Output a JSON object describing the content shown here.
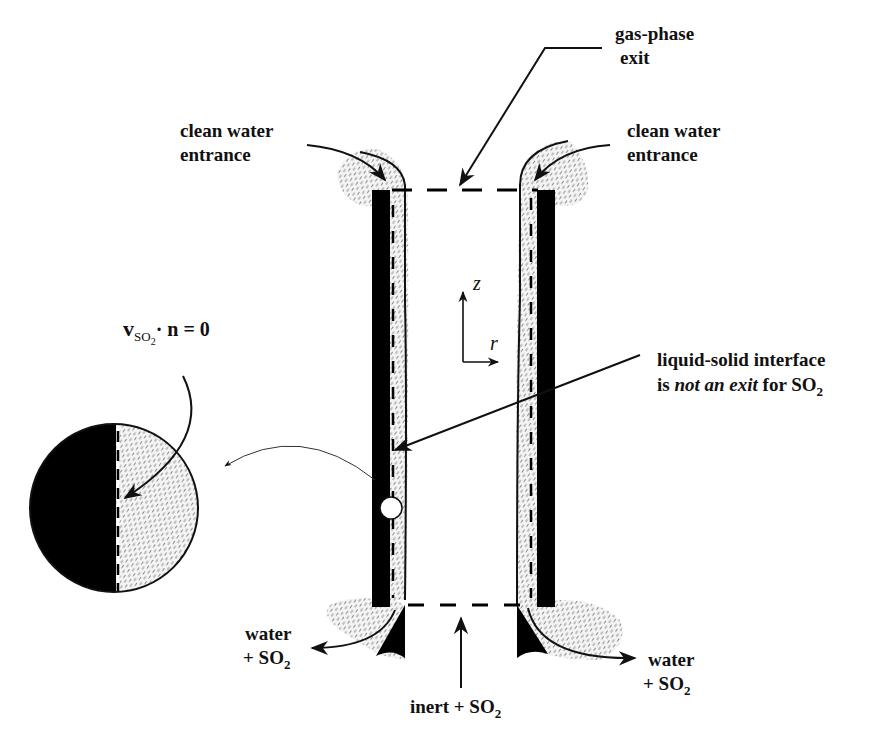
{
  "diagram": {
    "labels": {
      "gas_exit_line1": "gas-phase",
      "gas_exit_line2": "exit",
      "clean_left_line1": "clean water",
      "clean_left_line2": "entrance",
      "clean_right_line1": "clean water",
      "clean_right_line2": "entrance",
      "interface_line1": "liquid-solid interface",
      "interface_line2_prefix": "is ",
      "interface_line2_italic": "not an exit",
      "interface_line2_suffix": " for SO",
      "interface_sub": "2",
      "water_left_line1": "water",
      "water_left_line2": "+ SO",
      "water_left_sub": "2",
      "water_right_line1": "water",
      "water_right_line2": "+ SO",
      "water_right_sub": "2",
      "inlet": "inert + SO",
      "inlet_sub": "2",
      "equation_v": "v",
      "equation_sub": "SO",
      "equation_sub2": "2",
      "equation_rest": "· n = 0",
      "axis_z": "z",
      "axis_r": "r"
    },
    "colors": {
      "wall": "#000000",
      "film_hatch": "#8a8a8a",
      "line": "#111111",
      "background": "#ffffff"
    }
  }
}
